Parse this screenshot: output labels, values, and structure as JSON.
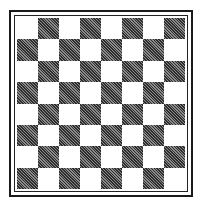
{
  "board": {
    "rows": 8,
    "cols": 8,
    "top_left": "light",
    "colors": {
      "light": "#ffffff",
      "dark": "#4a4a4a",
      "border": "#1a1a1a"
    },
    "style": "hatched dark squares, double-line frame"
  }
}
